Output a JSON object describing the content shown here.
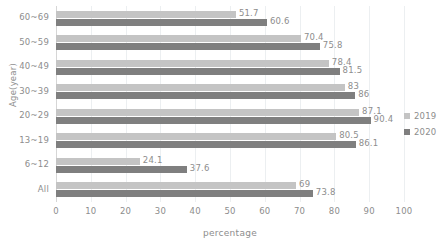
{
  "chart_data": {
    "type": "bar",
    "orientation": "horizontal",
    "title": "",
    "xlabel": "percentage",
    "ylabel": "Age(year)",
    "xlim": [
      0,
      100
    ],
    "xticks": [
      0,
      10,
      20,
      30,
      40,
      50,
      60,
      70,
      80,
      90,
      100
    ],
    "grid": true,
    "legend_position": "right",
    "categories": [
      "60~69",
      "50~59",
      "40~49",
      "30~39",
      "20~29",
      "13~19",
      "6~12",
      "All"
    ],
    "series": [
      {
        "name": "2019",
        "color": "#c4c4c4",
        "values": [
          51.7,
          70.4,
          78.4,
          83,
          87.1,
          80.5,
          24.1,
          69
        ],
        "labels": [
          "51.7",
          "70.4",
          "78.4",
          "83",
          "87.1",
          "80.5",
          "24.1",
          "69"
        ]
      },
      {
        "name": "2020",
        "color": "#7f7f7f",
        "values": [
          60.6,
          75.8,
          81.5,
          86,
          90.4,
          86.1,
          37.6,
          73.8
        ],
        "labels": [
          "60.6",
          "75.8",
          "81.5",
          "86",
          "90.4",
          "86.1",
          "37.6",
          "73.8"
        ]
      }
    ]
  },
  "legend": {
    "items": [
      {
        "label": "2019",
        "color": "#c4c4c4"
      },
      {
        "label": "2020",
        "color": "#7f7f7f"
      }
    ]
  }
}
